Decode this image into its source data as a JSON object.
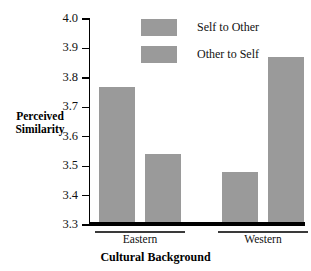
{
  "chart_data": {
    "type": "bar",
    "title": "",
    "xlabel": "Cultural Background",
    "ylabel": "Perceived Similarity",
    "ylim": [
      3.3,
      4.0
    ],
    "ytick_labels": [
      "4.0",
      "3.9",
      "3.8",
      "3.7",
      "3.6",
      "3.5",
      "3.4",
      "3.3"
    ],
    "ytick_values": [
      4.0,
      3.9,
      3.8,
      3.7,
      3.6,
      3.5,
      3.4,
      3.3
    ],
    "categories": [
      "Eastern",
      "Western"
    ],
    "grid": false,
    "legend_position": "top-center",
    "series": [
      {
        "name": "Self to Other",
        "color": "#9a9a9a",
        "values": [
          3.77,
          3.48
        ]
      },
      {
        "name": "Other to Self",
        "color": "#9a9a9a",
        "values": [
          3.54,
          3.87
        ]
      }
    ]
  },
  "axis": {
    "y_title_line1": "Perceived",
    "y_title_line2": "Similarity",
    "x_title": "Cultural Background"
  },
  "legend": {
    "items": [
      {
        "label": "Self to Other",
        "color": "#9a9a9a"
      },
      {
        "label": "Other to Self",
        "color": "#9a9a9a"
      }
    ]
  },
  "colors": {
    "bar": "#9a9a9a",
    "axis": "#000000",
    "text": "#111111",
    "background": "#ffffff"
  }
}
